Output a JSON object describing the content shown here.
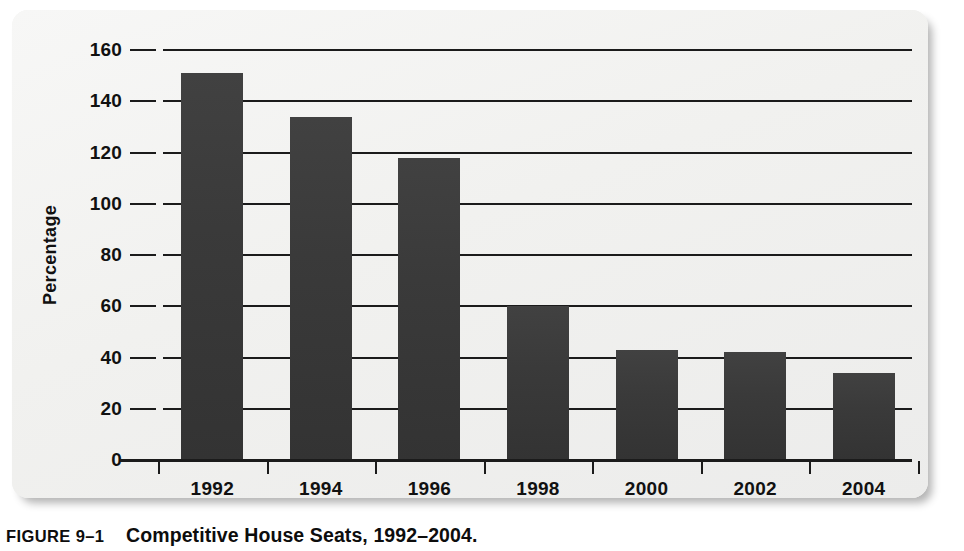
{
  "figure": {
    "number_label": "FIGURE 9–1",
    "title": "Competitive House Seats, 1992–2004.",
    "panel_background": "#f2f2f0"
  },
  "chart_data": {
    "type": "bar",
    "title": "Competitive House Seats, 1992–2004.",
    "xlabel": "",
    "ylabel": "Percentage",
    "categories": [
      "1992",
      "1994",
      "1996",
      "1998",
      "2000",
      "2002",
      "2004"
    ],
    "values": [
      151,
      134,
      118,
      60,
      43,
      42,
      34
    ],
    "ylim": [
      0,
      160
    ],
    "ytick_values": [
      0,
      20,
      40,
      60,
      80,
      100,
      120,
      140,
      160
    ],
    "ytick_labels": [
      "0",
      "20",
      "40",
      "60",
      "80",
      "100",
      "120",
      "140",
      "160"
    ],
    "grid": true,
    "grid_orientation": "horizontal",
    "legend": null,
    "series": [
      {
        "name": "Competitive House Seats",
        "color": "#3b3b3b",
        "values": [
          151,
          134,
          118,
          60,
          43,
          42,
          34
        ]
      }
    ],
    "axis_color": "#1b1b1b"
  }
}
